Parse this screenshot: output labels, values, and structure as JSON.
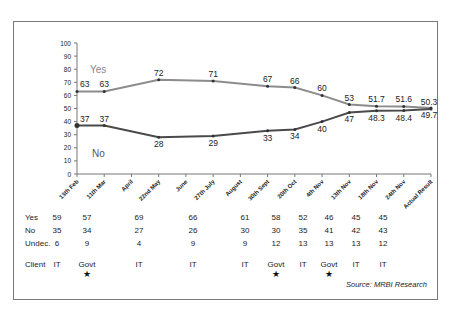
{
  "chart_data": {
    "type": "line",
    "title": "",
    "xlabel": "",
    "ylabel": "",
    "ylim": [
      0,
      100
    ],
    "yticks": [
      0,
      10,
      20,
      30,
      40,
      50,
      60,
      70,
      80,
      90,
      100
    ],
    "grid": false,
    "categories": [
      "13th Feb",
      "11th Mar",
      "April",
      "22nd May",
      "June",
      "27th July",
      "August",
      "30th Sept",
      "20th Oct",
      "4th Nov",
      "13th Nov",
      "18th Nov",
      "24th Nov",
      "Actual Result"
    ],
    "series": [
      {
        "name": "Yes",
        "color": "#8c8c8c",
        "points": [
          {
            "x": "13th Feb",
            "y": 63,
            "label": "63"
          },
          {
            "x": "11th Mar",
            "y": 63,
            "label": "63"
          },
          {
            "x": "22nd May",
            "y": 72,
            "label": "72"
          },
          {
            "x": "27th July",
            "y": 71,
            "label": "71"
          },
          {
            "x": "30th Sept",
            "y": 67,
            "label": "67"
          },
          {
            "x": "20th Oct",
            "y": 66,
            "label": "66"
          },
          {
            "x": "4th Nov",
            "y": 60,
            "label": "60"
          },
          {
            "x": "13th Nov",
            "y": 53,
            "label": "53"
          },
          {
            "x": "18th Nov",
            "y": 51.7,
            "label": "51.7"
          },
          {
            "x": "24th Nov",
            "y": 51.6,
            "label": "51.6"
          },
          {
            "x": "Actual Result",
            "y": 50.3,
            "label": "50.3"
          }
        ]
      },
      {
        "name": "No",
        "color": "#4a4a4a",
        "points": [
          {
            "x": "13th Feb",
            "y": 37,
            "label": "37"
          },
          {
            "x": "11th Mar",
            "y": 37,
            "label": "37"
          },
          {
            "x": "22nd May",
            "y": 28,
            "label": "28"
          },
          {
            "x": "27th July",
            "y": 29,
            "label": "29"
          },
          {
            "x": "30th Sept",
            "y": 33,
            "label": "33"
          },
          {
            "x": "20th Oct",
            "y": 34,
            "label": "34"
          },
          {
            "x": "4th Nov",
            "y": 40,
            "label": "40"
          },
          {
            "x": "13th Nov",
            "y": 47,
            "label": "47"
          },
          {
            "x": "18th Nov",
            "y": 48.3,
            "label": "48.3"
          },
          {
            "x": "24th Nov",
            "y": 48.4,
            "label": "48.4"
          },
          {
            "x": "Actual Result",
            "y": 49.7,
            "label": "49.7"
          }
        ]
      }
    ],
    "legend": {
      "Yes": "in-plot label upper-left",
      "No": "in-plot label lower-left"
    },
    "annotations": [],
    "table": {
      "row_labels": [
        "Yes",
        "No",
        "Undec.",
        "Client"
      ],
      "columns": [
        {
          "yes": "59",
          "no": "35",
          "undec": "6",
          "client": "IT",
          "star": false
        },
        {
          "yes": "57",
          "no": "34",
          "undec": "9",
          "client": "Govt",
          "star": true
        },
        {
          "yes": "69",
          "no": "27",
          "undec": "4",
          "client": "IT",
          "star": false
        },
        {
          "yes": "66",
          "no": "26",
          "undec": "9",
          "client": "IT",
          "star": false
        },
        {
          "yes": "61",
          "no": "30",
          "undec": "9",
          "client": "IT",
          "star": false
        },
        {
          "yes": "58",
          "no": "30",
          "undec": "12",
          "client": "Govt",
          "star": true
        },
        {
          "yes": "52",
          "no": "35",
          "undec": "13",
          "client": "IT",
          "star": false
        },
        {
          "yes": "46",
          "no": "41",
          "undec": "13",
          "client": "Govt",
          "star": true
        },
        {
          "yes": "45",
          "no": "42",
          "undec": "13",
          "client": "IT",
          "star": false
        },
        {
          "yes": "45",
          "no": "43",
          "undec": "12",
          "client": "IT",
          "star": false
        }
      ]
    },
    "source": "Source:  MRBI Research"
  },
  "labels": {
    "yes_series": "Yes",
    "no_series": "No",
    "row_yes": "Yes",
    "row_no": "No",
    "row_undec": "Undec.",
    "row_client": "Client",
    "source": "Source:  MRBI Research",
    "star": "★"
  }
}
